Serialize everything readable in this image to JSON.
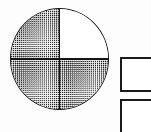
{
  "figure": {
    "background_color": "#fdfdfd",
    "line_color": "#151515",
    "shaded_fill": "halftone-dots",
    "unshaded_fill": "#ffffff",
    "circle": {
      "name": "quartered-circle",
      "shaded_parts": 3,
      "total_parts": 4,
      "fraction_label": "3/4",
      "quadrants": [
        {
          "position": "top-left",
          "state": "shaded"
        },
        {
          "position": "top-right",
          "state": "unshaded"
        },
        {
          "position": "bottom-left",
          "state": "shaded"
        },
        {
          "position": "bottom-right",
          "state": "shaded"
        }
      ]
    },
    "rectangles": [
      {
        "name": "upper-rectangle",
        "state": "empty",
        "clipped": "right-edge"
      },
      {
        "name": "lower-rectangle",
        "state": "empty",
        "clipped": "right-and-bottom-edge"
      }
    ]
  }
}
